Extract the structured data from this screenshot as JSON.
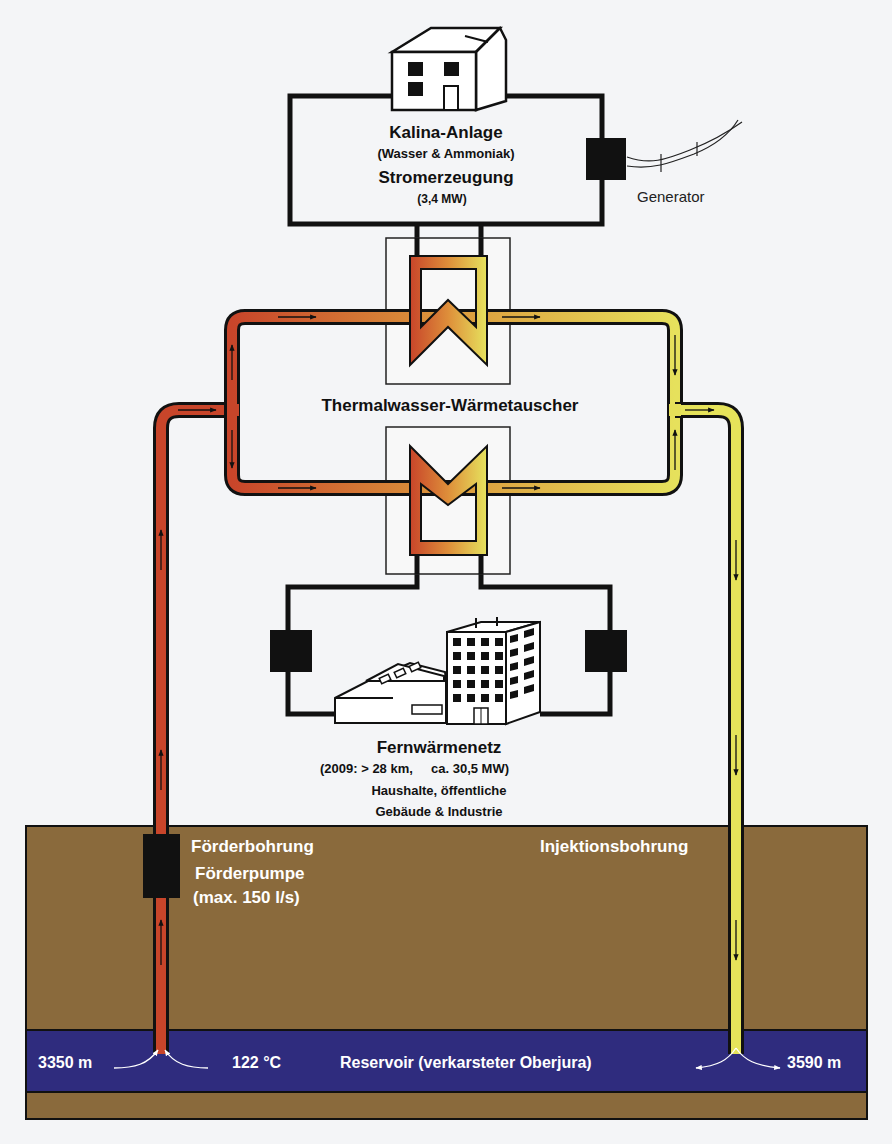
{
  "plant": {
    "title": "Kalina-Anlage",
    "subtitle": "(Wasser & Ammoniak)",
    "function": "Stromerzeugung",
    "power": "(3,4 MW)",
    "generator_label": "Generator"
  },
  "heat_exchanger": {
    "label": "Thermalwasser-Wärmetauscher"
  },
  "district_heating": {
    "title": "Fernwärmenetz",
    "details_year": "(2009: > 28 km,",
    "details_power": "ca. 30,5 MW)",
    "consumers_line1": "Haushalte, öffentliche",
    "consumers_line2": "Gebäude & Industrie"
  },
  "production_well": {
    "label": "Förderbohrung",
    "pump_label": "Förderpumpe",
    "pump_rate": "(max. 150 l/s)",
    "depth": "3350 m",
    "temperature": "122 °C"
  },
  "injection_well": {
    "label": "Injektionsbohrung",
    "depth": "3590 m"
  },
  "reservoir": {
    "label": "Reservoir (verkarsteter Oberjura)"
  },
  "colors": {
    "hot_pipe": "#c8452a",
    "mid_pipe": "#dc9a3c",
    "cold_pipe": "#e8e35a",
    "ground": "#8a6a3c",
    "reservoir": "#2f2c7e",
    "background": "#f4f5f7"
  }
}
